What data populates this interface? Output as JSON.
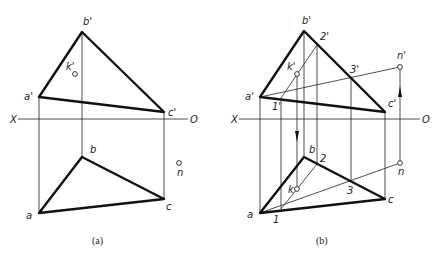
{
  "figure": {
    "panels": [
      {
        "id": "a",
        "caption": "(a)",
        "axis": {
          "left": "X",
          "right": "O"
        },
        "front_view": {
          "labels": {
            "a": "a'",
            "b": "b'",
            "c": "c'",
            "k": "k'"
          }
        },
        "top_view": {
          "labels": {
            "a": "a",
            "b": "b",
            "c": "c",
            "n": "n"
          }
        }
      },
      {
        "id": "b",
        "caption": "(b)",
        "axis": {
          "left": "X",
          "right": "O"
        },
        "front_view": {
          "labels": {
            "a": "a'",
            "b": "b'",
            "c": "c'",
            "k": "k'",
            "n": "n'",
            "p1": "1'",
            "p2": "2'",
            "p3": "3'"
          }
        },
        "top_view": {
          "labels": {
            "a": "a",
            "b": "b",
            "c": "c",
            "k": "k",
            "n": "n",
            "p1": "1",
            "p2": "2",
            "p3": "3"
          }
        }
      }
    ]
  }
}
